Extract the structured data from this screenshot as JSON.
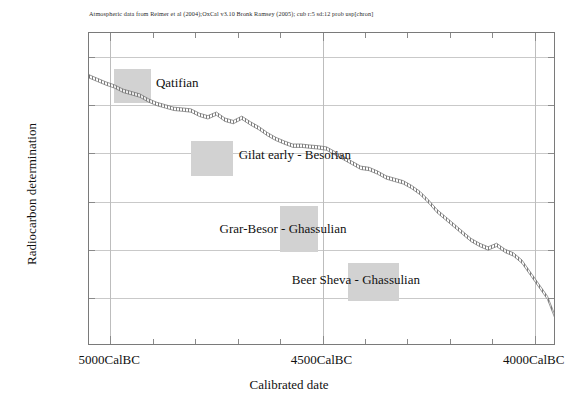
{
  "caption": "Atmospheric data from Reimer et al (2004);OxCal v3.10 Bronk Ramsey (2005); cub r:5 sd:12 prob usp[chron]",
  "axes": {
    "ylabel": "Radiocarbon determination",
    "xlabel": "Calibrated date"
  },
  "chart_data": {
    "type": "line",
    "title": "",
    "subtitle": "Atmospheric data from Reimer et al (2004);OxCal v3.10 Bronk Ramsey (2005); cub r:5 sd:12 prob usp[chron]",
    "xlabel": "Calibrated date",
    "ylabel": "Radiocarbon determination",
    "grid": true,
    "legend": "none",
    "xlim": [
      -5050,
      -3950
    ],
    "ylim": [
      5000,
      6300
    ],
    "x_tick_labels": [
      "5000CalBC",
      "4500CalBC",
      "4000CalBC"
    ],
    "x_tick_values": [
      -5000,
      -4500,
      -4000
    ],
    "x_minor_tick_step": 100,
    "y_tick_labels": [
      "6200BP",
      "6000BP",
      "5800BP",
      "5600BP",
      "5400BP",
      "5200BP",
      "5000BP"
    ],
    "y_tick_values": [
      6200,
      6000,
      5800,
      5600,
      5400,
      5200,
      5000
    ],
    "series": [
      {
        "name": "IntCal04 calibration curve",
        "style": "hatched-band",
        "x": [
          -5050,
          -5030,
          -5010,
          -4990,
          -4970,
          -4950,
          -4930,
          -4910,
          -4890,
          -4870,
          -4850,
          -4830,
          -4810,
          -4790,
          -4770,
          -4750,
          -4730,
          -4710,
          -4690,
          -4670,
          -4650,
          -4630,
          -4610,
          -4590,
          -4570,
          -4550,
          -4530,
          -4510,
          -4490,
          -4470,
          -4450,
          -4430,
          -4410,
          -4390,
          -4370,
          -4350,
          -4330,
          -4310,
          -4290,
          -4270,
          -4250,
          -4230,
          -4210,
          -4190,
          -4170,
          -4150,
          -4130,
          -4110,
          -4090,
          -4070,
          -4050,
          -4030,
          -4010,
          -3990,
          -3970,
          -3950
        ],
        "values": [
          6120,
          6105,
          6090,
          6078,
          6060,
          6050,
          6040,
          6020,
          6005,
          5995,
          5985,
          5982,
          5978,
          5960,
          5950,
          5965,
          5940,
          5930,
          5948,
          5925,
          5905,
          5880,
          5860,
          5845,
          5832,
          5832,
          5828,
          5825,
          5820,
          5800,
          5780,
          5760,
          5740,
          5735,
          5720,
          5700,
          5690,
          5680,
          5660,
          5635,
          5600,
          5560,
          5530,
          5500,
          5470,
          5440,
          5420,
          5405,
          5420,
          5395,
          5380,
          5350,
          5300,
          5250,
          5200,
          5110
        ],
        "band_width_years": 14
      }
    ],
    "annotations": [
      {
        "label": "Qatifian",
        "box_x": [
          -4990,
          -4905
        ],
        "box_y": [
          6010,
          6150
        ],
        "label_x": -4890,
        "label_y": 6088
      },
      {
        "label": "Gilat early - Besorian",
        "box_x": [
          -4810,
          -4710
        ],
        "box_y": [
          5705,
          5850
        ],
        "label_x": -4695,
        "label_y": 5790
      },
      {
        "label": "Grar-Besor - Ghassulian",
        "box_x": [
          -4600,
          -4510
        ],
        "box_y": [
          5390,
          5580
        ],
        "label_x": -4740,
        "label_y": 5480
      },
      {
        "label": "Beer Sheva - Ghassulian",
        "box_x": [
          -4440,
          -4320
        ],
        "box_y": [
          5185,
          5345
        ],
        "label_x": -4570,
        "label_y": 5270
      }
    ]
  },
  "colors": {
    "box_fill": "#d2d2d2",
    "axis": "#7a7a7a",
    "grid": "#c9c9c9",
    "curve": "#6f6f6f",
    "text": "#111111"
  }
}
